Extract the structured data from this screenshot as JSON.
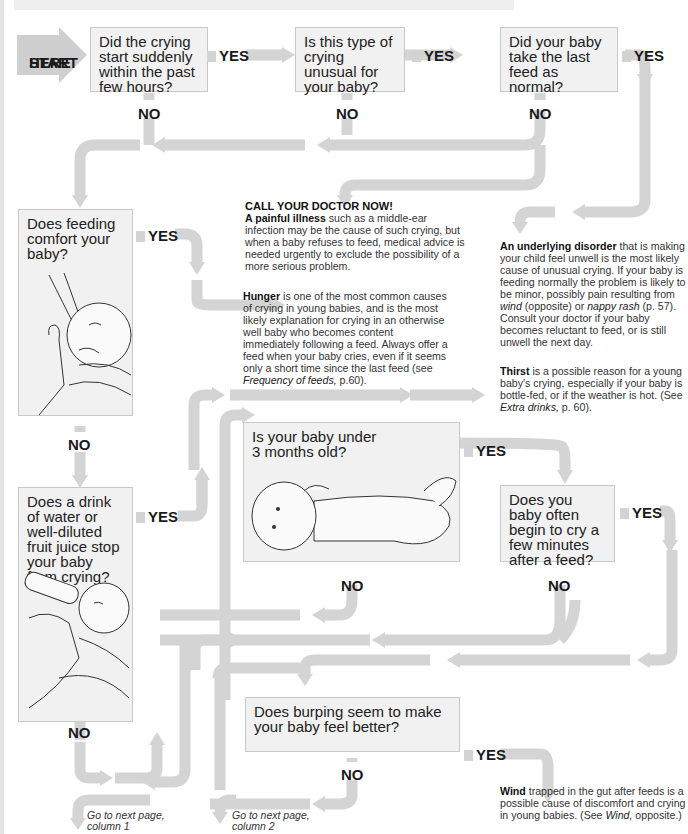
{
  "start": {
    "line1": "START",
    "line2": "HERE"
  },
  "questions": {
    "q1": "Did the crying start suddenly within the past few hours?",
    "q2": "Is this type of crying unusual for your baby?",
    "q3": "Did your baby take the last feed as normal?",
    "q4": "Does feeding comfort your baby?",
    "q5": "Does a drink of water or well-diluted fruit juice stop your baby from crying?",
    "q6_l1": "Is your baby under",
    "q6_l2": "3 months old?",
    "q7": "Does you baby often begin to cry a few minutes after a feed?",
    "q8": "Does burping seem to make your baby feel better?"
  },
  "labels": {
    "yes": "YES",
    "no": "NO"
  },
  "notes": {
    "doctor": {
      "heading": "CALL YOUR DOCTOR NOW!",
      "bold": "A painful illness",
      "text": " such as a middle-ear infection may be the cause of such crying, but when a baby refuses to feed, medical advice is needed urgently to exclude the possibility of a more serious problem."
    },
    "hunger": {
      "bold": "Hunger",
      "text": " is one of the most common causes of crying in young babies, and is the most likely explanation for crying in an otherwise well baby who becomes content immediately following a feed. Always offer a feed when your baby cries, even if it seems only a short time since the last feed (see ",
      "italic": "Frequency of feeds,",
      "tail": " p.60)."
    },
    "disorder": {
      "bold": "An underlying disorder",
      "text": " that is making your child feel unwell is the most likely cause of unusual crying. If your baby is feeding normally the problem is likely to be minor, possibly pain resulting from ",
      "italic1": "wind",
      "mid": " (opposite) or ",
      "italic2": "nappy rash",
      "tail": " (p. 57). Consult your doctor if your baby becomes reluctant to feed, or is still unwell the next day."
    },
    "thirst": {
      "bold": "Thirst",
      "text": " is a possible reason for a young baby's crying, especially if your baby is bottle-fed, or if the weather is hot. (See ",
      "italic": "Extra drinks,",
      "tail": " p. 60)."
    },
    "wind": {
      "bold": "Wind",
      "text": " trapped in the gut after feeds is a possible cause of discomfort and crying in young babies. (See ",
      "italic": "Wind,",
      "tail": " opposite.)"
    }
  },
  "goto": {
    "col1_l1": "Go to next page,",
    "col1_l2": "column 1",
    "col2_l1": "Go to next page,",
    "col2_l2": "column 2"
  },
  "illustrations": {
    "breastfeeding": "baby-breastfeeding-illustration",
    "bottle": "baby-bottle-feeding-illustration",
    "lying": "baby-lying-illustration"
  },
  "colors": {
    "arrow": "#d4d4d4",
    "box": "#f1f1f1",
    "box_border": "#c8c8c8",
    "text": "#1a1a1a"
  }
}
